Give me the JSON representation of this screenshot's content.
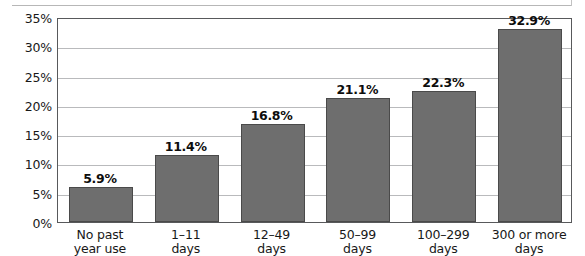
{
  "chart_data": {
    "type": "bar",
    "title": "",
    "subtitle": "",
    "xlabel": "",
    "ylabel": "",
    "ylim": [
      0,
      35
    ],
    "ytick_step": 5,
    "ytick_labels": [
      "0%",
      "5%",
      "10%",
      "15%",
      "20%",
      "25%",
      "30%",
      "35%"
    ],
    "ytick_values": [
      0,
      5,
      10,
      15,
      20,
      25,
      30,
      35
    ],
    "grid": true,
    "legend": false,
    "legend_position": "none",
    "categories": [
      "No past year use",
      "1–11 days",
      "12–49 days",
      "50–99 days",
      "100–299 days",
      "300 or more days"
    ],
    "category_lines": [
      [
        "No past",
        "year use"
      ],
      [
        "1–11",
        "days"
      ],
      [
        "12–49",
        "days"
      ],
      [
        "50–99",
        "days"
      ],
      [
        "100–299",
        "days"
      ],
      [
        "300 or more",
        "days"
      ]
    ],
    "values": [
      5.9,
      11.4,
      16.8,
      21.1,
      22.3,
      32.9
    ],
    "value_labels": [
      "5.9%",
      "11.4%",
      "16.8%",
      "21.1%",
      "22.3%",
      "32.9%"
    ],
    "bar_color": "#6e6e6e",
    "bar_border_color": "#4a4a4a",
    "gridline_color": "#b9babc",
    "axis_color": "#58595b",
    "text_color": "#181818"
  }
}
